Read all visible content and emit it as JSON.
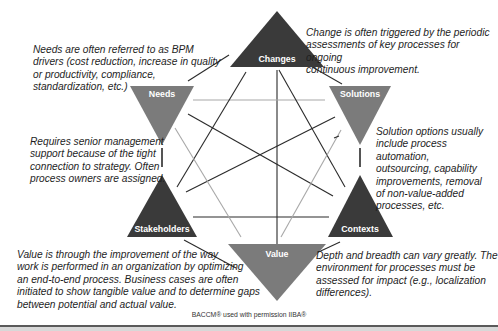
{
  "diagram": {
    "type": "BACCM hexagram",
    "colors": {
      "dark_triangle": "#3a3a3a",
      "gray_triangle": "#7b7b7b",
      "dark_line": "#2a2a2a",
      "light_line": "#a8a8a8",
      "text": "#1e1e1e"
    },
    "nodes": [
      {
        "id": "changes",
        "label": "Changes"
      },
      {
        "id": "needs",
        "label": "Needs"
      },
      {
        "id": "solutions",
        "label": "Solutions"
      },
      {
        "id": "stakeholders",
        "label": "Stakeholders"
      },
      {
        "id": "contexts",
        "label": "Contexts"
      },
      {
        "id": "value",
        "label": "Value"
      }
    ],
    "notes": {
      "needs": [
        "Needs are often referred to as BPM",
        "drivers (cost reduction, increase in quality",
        "or productivity, compliance,",
        "standardization, etc.)"
      ],
      "changes": [
        "Change is often triggered by the periodic",
        "assessments of key processes for ongoing",
        "continuous improvement."
      ],
      "stakeholders": [
        "Requires senior management",
        "support because of the tight",
        "connection to strategy. Often",
        "process owners are assigned."
      ],
      "solutions": [
        "Solution options usually",
        "include process automation,",
        "outsourcing, capability",
        "improvements, removal",
        "of non-value-added",
        "processes, etc."
      ],
      "value": [
        "Value is through the improvement of the way",
        "work is performed in an organization by optimizing",
        "an end-to-end process. Business cases are often",
        "initiated to show tangible value and to determine gaps",
        "between potential and actual value."
      ],
      "contexts": [
        "Depth and breadth can vary greatly. The",
        "environment for processes must be",
        "assessed for impact (e.g., localization",
        "differences)."
      ]
    },
    "credit": "BACCM® used with permission IIBA®"
  }
}
